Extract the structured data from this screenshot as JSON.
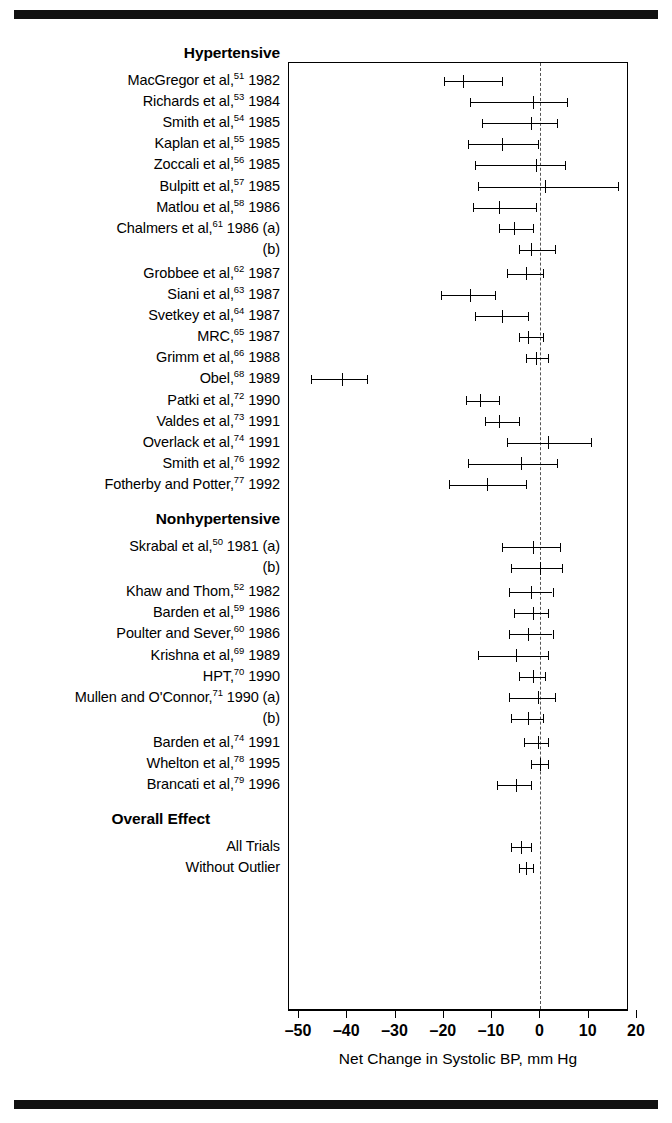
{
  "figure": {
    "axis_title": "Net Change in Systolic BP, mm Hg",
    "ticks": [
      -50,
      -40,
      -30,
      -20,
      -10,
      0,
      10,
      20
    ],
    "tick_labels": [
      "–50",
      "–40",
      "–30",
      "–20",
      "–10",
      "0",
      "10",
      "20"
    ],
    "null_line_value": 0,
    "group_headers": [
      "Hypertensive",
      "Nonhypertensive",
      "Overall Effect"
    ]
  },
  "chart_data": {
    "type": "scatter",
    "title": "",
    "xlabel": "Net Change in Systolic BP, mm Hg",
    "ylabel": "",
    "xlim": [
      -50,
      20
    ],
    "grid": false,
    "legend": "none",
    "orientation": "forest-plot",
    "sections": [
      {
        "header": "Hypertensive",
        "rows": [
          {
            "label_html": "MacGregor et al,<sup>51</sup> 1982",
            "label_text": "MacGregor et al,51 1982",
            "estimate": -16.0,
            "ci_low": -20.0,
            "ci_high": -8.0
          },
          {
            "label_html": "Richards et al,<sup>53</sup> 1984",
            "label_text": "Richards et al,53 1984",
            "estimate": -1.5,
            "ci_low": -14.5,
            "ci_high": 5.5
          },
          {
            "label_html": "Smith et al,<sup>54</sup> 1985",
            "label_text": "Smith et al,54 1985",
            "estimate": -2.0,
            "ci_low": -12.0,
            "ci_high": 3.5
          },
          {
            "label_html": "Kaplan et al,<sup>55</sup> 1985",
            "label_text": "Kaplan et al,55 1985",
            "estimate": -8.0,
            "ci_low": -15.0,
            "ci_high": -0.5
          },
          {
            "label_html": "Zoccali et al,<sup>56</sup> 1985",
            "label_text": "Zoccali et al,56 1985",
            "estimate": -1.0,
            "ci_low": -13.5,
            "ci_high": 5.0
          },
          {
            "label_html": "Bulpitt et al,<sup>57</sup> 1985",
            "label_text": "Bulpitt et al,57 1985",
            "estimate": 1.0,
            "ci_low": -13.0,
            "ci_high": 16.0
          },
          {
            "label_html": "Matlou et al,<sup>58</sup> 1986",
            "label_text": "Matlou et al,58 1986",
            "estimate": -8.5,
            "ci_low": -14.0,
            "ci_high": -1.0
          },
          {
            "label_html": "Chalmers et al,<sup>61</sup> 1986 (a)",
            "label_text": "Chalmers et al,61 1986 (a)",
            "estimate": -5.5,
            "ci_low": -8.5,
            "ci_high": -1.5
          },
          {
            "label_html": "(b)",
            "label_text": "(b)",
            "estimate": -2.0,
            "ci_low": -4.5,
            "ci_high": 3.0
          },
          {
            "label_html": "Grobbee et al,<sup>62</sup> 1987",
            "label_text": "Grobbee et al,62 1987",
            "estimate": -3.0,
            "ci_low": -7.0,
            "ci_high": 0.5
          },
          {
            "label_html": "Siani et al,<sup>63</sup> 1987",
            "label_text": "Siani et al,63 1987",
            "estimate": -14.5,
            "ci_low": -20.5,
            "ci_high": -9.5
          },
          {
            "label_html": "Svetkey et al,<sup>64</sup> 1987",
            "label_text": "Svetkey et al,64 1987",
            "estimate": -8.0,
            "ci_low": -13.5,
            "ci_high": -2.5
          },
          {
            "label_html": "MRC,<sup>65</sup> 1987",
            "label_text": "MRC,65 1987",
            "estimate": -2.5,
            "ci_low": -4.5,
            "ci_high": 0.5
          },
          {
            "label_html": "Grimm et al,<sup>66</sup> 1988",
            "label_text": "Grimm et al,66 1988",
            "estimate": -1.0,
            "ci_low": -3.0,
            "ci_high": 1.5
          },
          {
            "label_html": "Obel,<sup>68</sup> 1989",
            "label_text": "Obel,68 1989",
            "estimate": -41.0,
            "ci_low": -47.5,
            "ci_high": -36.0
          },
          {
            "label_html": "Patki et al,<sup>72</sup> 1990",
            "label_text": "Patki et al,72 1990",
            "estimate": -12.5,
            "ci_low": -15.5,
            "ci_high": -8.5
          },
          {
            "label_html": "Valdes et al,<sup>73</sup> 1991",
            "label_text": "Valdes et al,73 1991",
            "estimate": -8.5,
            "ci_low": -11.5,
            "ci_high": -4.5
          },
          {
            "label_html": "Overlack et al,<sup>74</sup> 1991",
            "label_text": "Overlack et al,74 1991",
            "estimate": 1.5,
            "ci_low": -7.0,
            "ci_high": 10.5
          },
          {
            "label_html": "Smith et al,<sup>76</sup> 1992",
            "label_text": "Smith et al,76 1992",
            "estimate": -4.0,
            "ci_low": -15.0,
            "ci_high": 3.5
          },
          {
            "label_html": "Fotherby and Potter,<sup>77</sup> 1992",
            "label_text": "Fotherby and Potter,77 1992",
            "estimate": -11.0,
            "ci_low": -19.0,
            "ci_high": -3.0
          }
        ]
      },
      {
        "header": "Nonhypertensive",
        "rows": [
          {
            "label_html": "Skrabal et al,<sup>50</sup> 1981 (a)",
            "label_text": "Skrabal et al,50 1981 (a)",
            "estimate": -1.5,
            "ci_low": -8.0,
            "ci_high": 4.0
          },
          {
            "label_html": "(b)",
            "label_text": "(b)",
            "estimate": 0.0,
            "ci_low": -6.0,
            "ci_high": 4.5
          },
          {
            "label_html": "Khaw and Thom,<sup>52</sup> 1982",
            "label_text": "Khaw and Thom,52 1982",
            "estimate": -2.0,
            "ci_low": -6.5,
            "ci_high": 2.5
          },
          {
            "label_html": "Barden et al,<sup>59</sup> 1986",
            "label_text": "Barden et al,59 1986",
            "estimate": -1.5,
            "ci_low": -5.5,
            "ci_high": 1.5
          },
          {
            "label_html": "Poulter and Sever,<sup>60</sup> 1986",
            "label_text": "Poulter and Sever,60 1986",
            "estimate": -2.5,
            "ci_low": -6.5,
            "ci_high": 2.5
          },
          {
            "label_html": "Krishna et al,<sup>69</sup> 1989",
            "label_text": "Krishna et al,69 1989",
            "estimate": -5.0,
            "ci_low": -13.0,
            "ci_high": 1.5
          },
          {
            "label_html": "HPT,<sup>70</sup> 1990",
            "label_text": "HPT,70 1990",
            "estimate": -1.5,
            "ci_low": -4.5,
            "ci_high": 1.0
          },
          {
            "label_html": "Mullen and O'Connor,<sup>71</sup> 1990 (a)",
            "label_text": "Mullen and O'Connor,71 1990 (a)",
            "estimate": -0.5,
            "ci_low": -6.5,
            "ci_high": 3.0
          },
          {
            "label_html": "(b)",
            "label_text": "(b)",
            "estimate": -2.5,
            "ci_low": -6.0,
            "ci_high": 0.5
          },
          {
            "label_html": "Barden et al,<sup>74</sup> 1991",
            "label_text": "Barden et al,74 1991",
            "estimate": -0.5,
            "ci_low": -3.5,
            "ci_high": 1.5
          },
          {
            "label_html": "Whelton et al,<sup>78</sup> 1995",
            "label_text": "Whelton et al,78 1995",
            "estimate": 0.0,
            "ci_low": -2.0,
            "ci_high": 1.5
          },
          {
            "label_html": "Brancati et al,<sup>79</sup> 1996",
            "label_text": "Brancati et al,79 1996",
            "estimate": -5.0,
            "ci_low": -9.0,
            "ci_high": -2.0
          }
        ]
      },
      {
        "header": "Overall Effect",
        "rows": [
          {
            "label_html": "All Trials",
            "label_text": "All Trials",
            "estimate": -4.0,
            "ci_low": -6.0,
            "ci_high": -2.0
          },
          {
            "label_html": "Without Outlier",
            "label_text": "Without Outlier",
            "estimate": -3.0,
            "ci_low": -4.5,
            "ci_high": -1.5
          }
        ]
      }
    ]
  }
}
